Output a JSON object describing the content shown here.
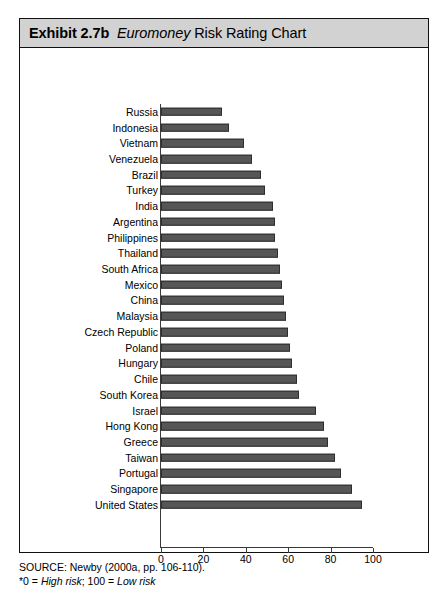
{
  "exhibit": {
    "header": {
      "number_label": "Exhibit 2.7b",
      "italic_word": "Euromoney",
      "rest": "Risk Rating Chart",
      "full_title": "Exhibit 2.7b  Euromoney Risk Rating Chart"
    },
    "footer": {
      "source_line": "SOURCE: Newby (2000a, pp. 106-110).",
      "note_prefix": "*0 = ",
      "note_italic_1": "High risk",
      "note_middle": "; 100 = ",
      "note_italic_2": "Low risk",
      "note_full": "*0 = High risk; 100 = Low risk"
    }
  },
  "chart_data": {
    "type": "bar",
    "orientation": "horizontal",
    "xlabel": "",
    "ylabel": "",
    "xlim": [
      0,
      100
    ],
    "ticks": [
      0,
      20,
      40,
      60,
      80,
      100
    ],
    "tick_labels": [
      "0",
      "20",
      "40",
      "60",
      "80",
      "100"
    ],
    "grid": false,
    "legend": "none",
    "bar_color": "#565656",
    "bar_edge_color": "#2e2e2e",
    "categories": [
      "Russia",
      "Indonesia",
      "Vietnam",
      "Venezuela",
      "Brazil",
      "Turkey",
      "India",
      "Argentina",
      "Philippines",
      "Thailand",
      "South Africa",
      "Mexico",
      "China",
      "Malaysia",
      "Czech Republic",
      "Poland",
      "Hungary",
      "Chile",
      "South Korea",
      "Israel",
      "Hong Kong",
      "Greece",
      "Taiwan",
      "Portugal",
      "Singapore",
      "United States"
    ],
    "values": [
      29,
      32,
      39,
      43,
      47,
      49,
      53,
      54,
      54,
      55,
      56,
      57,
      58,
      59,
      60,
      61,
      62,
      64,
      65,
      73,
      77,
      79,
      82,
      85,
      90,
      95
    ]
  }
}
